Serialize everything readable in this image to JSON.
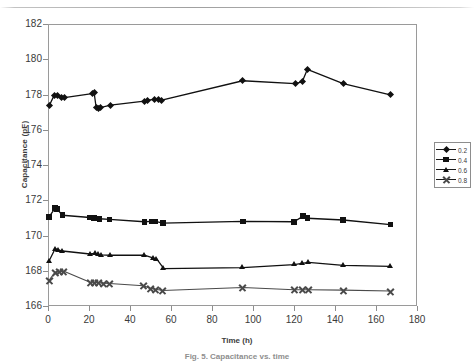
{
  "figure": {
    "caption": "Fig. 5. Capacitance vs. time",
    "xlabel": "Time (h)",
    "ylabel": "Capacitance (pF)"
  },
  "legend": {
    "position": "right",
    "entries": [
      {
        "label": "0.2",
        "marker": "diamond"
      },
      {
        "label": "0.4",
        "marker": "square"
      },
      {
        "label": "0.6",
        "marker": "triangle"
      },
      {
        "label": "0.8",
        "marker": "cross"
      }
    ]
  },
  "axes": {
    "y_ticks": [
      "182",
      "180",
      "178",
      "176",
      "174",
      "172",
      "170",
      "168",
      "166"
    ],
    "x_ticks": [
      "0",
      "20",
      "40",
      "60",
      "80",
      "100",
      "120",
      "140",
      "160",
      "180"
    ]
  },
  "chart_data": {
    "type": "scatter",
    "title": "",
    "xlabel": "Time (h)",
    "ylabel": "Capacitance (pF)",
    "xlim": [
      0,
      180
    ],
    "ylim": [
      166,
      182
    ],
    "xtick_step": 20,
    "ytick_step": 2,
    "grid": "horizontal",
    "legend_position": "right",
    "series": [
      {
        "name": "0.2",
        "marker": "diamond",
        "color": "#111111",
        "points": [
          [
            0.5,
            177.35
          ],
          [
            3.0,
            177.95
          ],
          [
            4.5,
            177.97
          ],
          [
            6.5,
            177.85
          ],
          [
            8.0,
            177.82
          ],
          [
            21.5,
            178.05
          ],
          [
            22.5,
            178.1
          ],
          [
            23.5,
            177.25
          ],
          [
            24.5,
            177.22
          ],
          [
            25.5,
            177.25
          ],
          [
            30.5,
            177.4
          ],
          [
            47.0,
            177.62
          ],
          [
            48.5,
            177.68
          ],
          [
            52.0,
            177.72
          ],
          [
            54.0,
            177.7
          ],
          [
            55.5,
            177.68
          ],
          [
            95.0,
            178.78
          ],
          [
            120.5,
            178.62
          ],
          [
            124.0,
            178.72
          ],
          [
            126.5,
            179.42
          ],
          [
            144.0,
            178.62
          ],
          [
            167.0,
            177.98
          ]
        ]
      },
      {
        "name": "0.4",
        "marker": "square",
        "color": "#111111",
        "points": [
          [
            0.5,
            171.05
          ],
          [
            3.5,
            171.55
          ],
          [
            4.5,
            171.5
          ],
          [
            7.0,
            171.15
          ],
          [
            20.5,
            171.02
          ],
          [
            22.5,
            170.98
          ],
          [
            24.0,
            170.96
          ],
          [
            25.0,
            170.95
          ],
          [
            30.0,
            170.92
          ],
          [
            47.0,
            170.78
          ],
          [
            50.5,
            170.8
          ],
          [
            52.5,
            170.8
          ],
          [
            56.0,
            170.7
          ],
          [
            95.0,
            170.8
          ],
          [
            120.0,
            170.78
          ],
          [
            124.5,
            171.1
          ],
          [
            126.5,
            170.98
          ],
          [
            144.0,
            170.88
          ],
          [
            167.0,
            170.62
          ]
        ]
      },
      {
        "name": "0.6",
        "marker": "triangle",
        "color": "#111111",
        "points": [
          [
            0.5,
            168.55
          ],
          [
            3.5,
            169.25
          ],
          [
            5.0,
            169.18
          ],
          [
            7.0,
            169.12
          ],
          [
            20.5,
            168.95
          ],
          [
            23.0,
            168.98
          ],
          [
            24.5,
            168.92
          ],
          [
            26.0,
            168.9
          ],
          [
            30.5,
            168.88
          ],
          [
            47.0,
            168.88
          ],
          [
            51.5,
            168.72
          ],
          [
            53.0,
            168.68
          ],
          [
            56.5,
            168.12
          ],
          [
            95.0,
            168.18
          ],
          [
            120.0,
            168.35
          ],
          [
            124.0,
            168.42
          ],
          [
            127.0,
            168.48
          ],
          [
            144.0,
            168.3
          ],
          [
            167.0,
            168.25
          ]
        ]
      },
      {
        "name": "0.8",
        "marker": "cross",
        "color": "#4a4a4a",
        "points": [
          [
            0.5,
            167.45
          ],
          [
            3.5,
            167.92
          ],
          [
            5.5,
            167.95
          ],
          [
            7.5,
            167.98
          ],
          [
            20.5,
            167.35
          ],
          [
            22.5,
            167.35
          ],
          [
            24.5,
            167.32
          ],
          [
            27.0,
            167.3
          ],
          [
            30.0,
            167.28
          ],
          [
            46.5,
            167.15
          ],
          [
            50.0,
            167.0
          ],
          [
            52.5,
            166.95
          ],
          [
            56.0,
            166.88
          ],
          [
            95.0,
            167.05
          ],
          [
            120.0,
            166.92
          ],
          [
            124.0,
            166.92
          ],
          [
            127.0,
            166.92
          ],
          [
            144.0,
            166.9
          ],
          [
            167.0,
            166.85
          ]
        ]
      }
    ]
  }
}
